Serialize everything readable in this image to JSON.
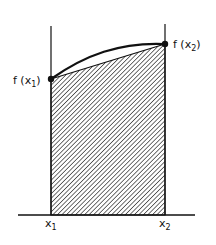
{
  "diagram": {
    "type": "trapezoid-rule-area",
    "labels": {
      "f_x1": "f(x₁)",
      "f_x2": "f(x₂)",
      "x1": "x₁",
      "x2": "x₂"
    },
    "label_parts": {
      "f_x1": {
        "pre": "f (x",
        "sub": "1",
        "post": ")"
      },
      "f_x2": {
        "pre": "f (x",
        "sub": "2",
        "post": ")"
      },
      "x1": {
        "pre": "x",
        "sub": "1"
      },
      "x2": {
        "pre": "x",
        "sub": "2"
      }
    },
    "colors": {
      "ink": "#111111",
      "background": "#ffffff"
    },
    "shading": "diagonal-hatch"
  }
}
